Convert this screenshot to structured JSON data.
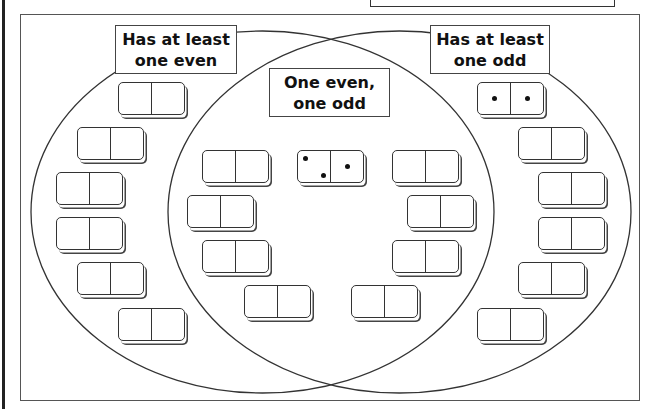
{
  "header": {
    "partial_box_text": "g"
  },
  "venn": {
    "sets": [
      {
        "id": "even",
        "label": "Has at least\none even"
      },
      {
        "id": "odd",
        "label": "Has at least\none odd"
      }
    ],
    "intersection_label": "One even,\none odd",
    "ellipses": {
      "left": {
        "cx": 262.5,
        "cy": 212,
        "rx": 231.5,
        "ry": 181
      },
      "right": {
        "cx": 399.5,
        "cy": 212,
        "rx": 231.5,
        "ry": 181
      }
    }
  },
  "dominoes": [
    {
      "region": "even-only",
      "x": 118,
      "y": 82,
      "left_pips": 0,
      "right_pips": 0
    },
    {
      "region": "even-only",
      "x": 77,
      "y": 127,
      "left_pips": 0,
      "right_pips": 0
    },
    {
      "region": "even-only",
      "x": 56,
      "y": 172,
      "left_pips": 0,
      "right_pips": 0
    },
    {
      "region": "even-only",
      "x": 56,
      "y": 217,
      "left_pips": 0,
      "right_pips": 0
    },
    {
      "region": "even-only",
      "x": 77,
      "y": 262,
      "left_pips": 0,
      "right_pips": 0
    },
    {
      "region": "even-only",
      "x": 118,
      "y": 308,
      "left_pips": 0,
      "right_pips": 0
    },
    {
      "region": "intersection",
      "x": 202,
      "y": 150,
      "left_pips": 0,
      "right_pips": 0
    },
    {
      "region": "intersection",
      "x": 187,
      "y": 195,
      "left_pips": 0,
      "right_pips": 0
    },
    {
      "region": "intersection",
      "x": 202,
      "y": 240,
      "left_pips": 0,
      "right_pips": 0
    },
    {
      "region": "intersection",
      "x": 244,
      "y": 285,
      "left_pips": 0,
      "right_pips": 0
    },
    {
      "region": "intersection",
      "x": 297,
      "y": 150,
      "left_pips": 2,
      "right_pips": 1
    },
    {
      "region": "intersection",
      "x": 392,
      "y": 150,
      "left_pips": 0,
      "right_pips": 0
    },
    {
      "region": "intersection",
      "x": 407,
      "y": 195,
      "left_pips": 0,
      "right_pips": 0
    },
    {
      "region": "intersection",
      "x": 392,
      "y": 240,
      "left_pips": 0,
      "right_pips": 0
    },
    {
      "region": "intersection",
      "x": 351,
      "y": 285,
      "left_pips": 0,
      "right_pips": 0
    },
    {
      "region": "odd-only",
      "x": 477,
      "y": 82,
      "left_pips": 1,
      "right_pips": 1
    },
    {
      "region": "odd-only",
      "x": 518,
      "y": 127,
      "left_pips": 0,
      "right_pips": 0
    },
    {
      "region": "odd-only",
      "x": 538,
      "y": 172,
      "left_pips": 0,
      "right_pips": 0
    },
    {
      "region": "odd-only",
      "x": 538,
      "y": 217,
      "left_pips": 0,
      "right_pips": 0
    },
    {
      "region": "odd-only",
      "x": 518,
      "y": 262,
      "left_pips": 0,
      "right_pips": 0
    },
    {
      "region": "odd-only",
      "x": 477,
      "y": 308,
      "left_pips": 0,
      "right_pips": 0
    }
  ],
  "colors": {
    "line": "#333333",
    "background": "#ffffff",
    "pip": "#111111"
  }
}
